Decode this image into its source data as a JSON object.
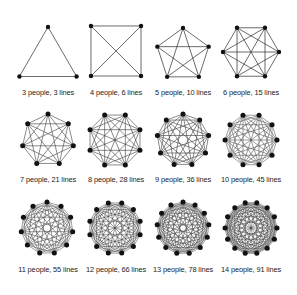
{
  "diagram": {
    "colors": {
      "line": "#3a3a3a",
      "dot": "#111111",
      "text": "#222222",
      "background": "#ffffff"
    },
    "graphs": [
      {
        "n": 3,
        "lines": 3,
        "label": "3 people, 3 lines",
        "cx": 48,
        "cy": 60,
        "r": 33,
        "rotation": -90
      },
      {
        "n": 4,
        "lines": 6,
        "label": "4 people, 6 lines",
        "cx": 116,
        "cy": 51,
        "r": 35.4,
        "rotation": -135
      },
      {
        "n": 5,
        "lines": 10,
        "label": "5 people, 10 lines",
        "cx": 183,
        "cy": 55,
        "r": 27,
        "rotation": -90
      },
      {
        "n": 6,
        "lines": 15,
        "label": "6 people, 15 lines",
        "cx": 251,
        "cy": 52,
        "r": 28,
        "rotation": -120
      },
      {
        "n": 7,
        "lines": 21,
        "label": "7 people, 21 lines",
        "cx": 48,
        "cy": 140,
        "r": 26,
        "rotation": -90
      },
      {
        "n": 8,
        "lines": 28,
        "label": "8 people, 28 lines",
        "cx": 115,
        "cy": 140,
        "r": 27,
        "rotation": -112.5
      },
      {
        "n": 9,
        "lines": 36,
        "label": "9 people, 36 lines",
        "cx": 183,
        "cy": 140,
        "r": 26,
        "rotation": -90
      },
      {
        "n": 10,
        "lines": 45,
        "label": "10 people, 45 lines",
        "cx": 251,
        "cy": 140,
        "r": 26,
        "rotation": -108
      },
      {
        "n": 11,
        "lines": 55,
        "label": "11 people, 55 lines",
        "cx": 47,
        "cy": 228,
        "r": 26,
        "rotation": -90
      },
      {
        "n": 12,
        "lines": 66,
        "label": "12 people, 66 lines",
        "cx": 115,
        "cy": 228,
        "r": 26,
        "rotation": -105
      },
      {
        "n": 13,
        "lines": 78,
        "label": "13 people, 78 lines",
        "cx": 183,
        "cy": 228,
        "r": 26,
        "rotation": -90
      },
      {
        "n": 14,
        "lines": 91,
        "label": "14 people, 91 lines",
        "cx": 251,
        "cy": 228,
        "r": 26,
        "rotation": -102.857
      }
    ],
    "label_rows_y": [
      92,
      179,
      269
    ]
  }
}
